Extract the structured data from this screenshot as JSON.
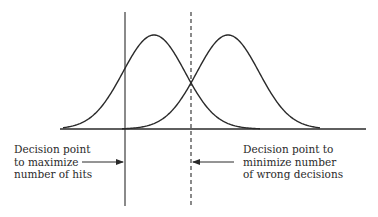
{
  "diagram": {
    "type": "signal-detection-distributions",
    "distributions": [
      {
        "name": "noise",
        "peak_position": "left"
      },
      {
        "name": "signal",
        "peak_position": "right"
      }
    ],
    "decision_points": [
      {
        "name": "maximize-hits",
        "style": "solid",
        "label_lines": [
          "Decision point",
          "to maximize",
          "number of hits"
        ]
      },
      {
        "name": "minimize-wrong-decisions",
        "style": "dashed",
        "label_lines": [
          "Decision point to",
          "minimize number",
          "of wrong decisions"
        ]
      }
    ],
    "colors": {
      "line": "#2a2a2a",
      "background": "#ffffff"
    }
  }
}
